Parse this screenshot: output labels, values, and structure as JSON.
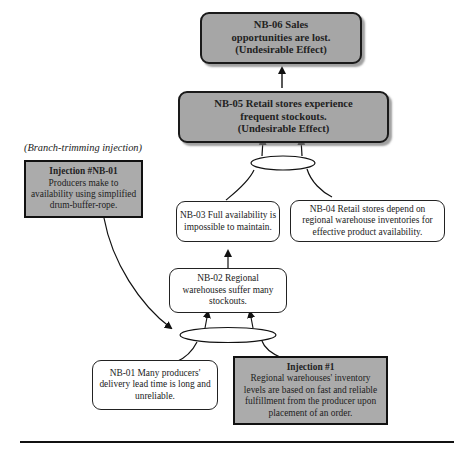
{
  "diagram": {
    "type": "future-reality-tree",
    "annotation": "(Branch-trimming injection)",
    "nodes": {
      "nb06": {
        "id": "NB-06",
        "lines": [
          "NB-06 Sales",
          "opportunities are lost.",
          "(Undesirable Effect)"
        ],
        "style": "undesirable-effect"
      },
      "nb05": {
        "id": "NB-05",
        "lines": [
          "NB-05 Retail stores experience",
          "frequent stockouts.",
          "(Undesirable Effect)"
        ],
        "style": "undesirable-effect"
      },
      "nb04": {
        "id": "NB-04",
        "lines": [
          "NB-04 Retail stores depend on",
          "regional warehouse inventories for",
          "effective product availability."
        ],
        "style": "entity"
      },
      "nb03": {
        "id": "NB-03",
        "lines": [
          "NB-03 Full availability is",
          "impossible to maintain."
        ],
        "style": "entity"
      },
      "nb02": {
        "id": "NB-02",
        "lines": [
          "NB-02 Regional",
          "warehouses suffer many",
          "stockouts."
        ],
        "style": "entity"
      },
      "nb01": {
        "id": "NB-01",
        "lines": [
          "NB-01 Many producers'",
          "delivery lead time is long and",
          "unreliable."
        ],
        "style": "entity"
      },
      "injnb01": {
        "title": "Injection #NB-01",
        "lines": [
          "Producers make to",
          "availability using simplified",
          "drum-buffer-rope."
        ],
        "style": "injection"
      },
      "inj1": {
        "title": "Injection #1",
        "lines": [
          "Regional warehouses' inventory",
          "levels are based on fast and reliable",
          "fulfillment from the producer upon",
          "placement of an order."
        ],
        "style": "injection"
      }
    },
    "edges": [
      {
        "from": "nb05",
        "to": "nb06"
      },
      {
        "from": [
          "nb03",
          "nb04"
        ],
        "to": "nb05",
        "logic": "and"
      },
      {
        "from": "nb02",
        "to": "nb03"
      },
      {
        "from": [
          "nb01",
          "inj1"
        ],
        "to": "nb02",
        "logic": "and"
      },
      {
        "from": "injnb01",
        "to": "and-nb01-inj1",
        "kind": "trimming"
      }
    ],
    "colors": {
      "ude_fill": "#a6a6a6",
      "injection_fill": "#ababab",
      "border": "#1a1a1a",
      "background": "#ffffff"
    }
  }
}
